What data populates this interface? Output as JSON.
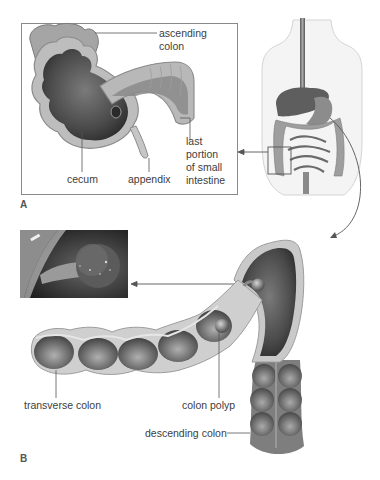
{
  "figure": {
    "panels": [
      {
        "id": "A",
        "letter": "A",
        "title": "Cecum region of large intestine (cutaway inset)",
        "labels": {
          "ascending_colon_line1": "ascending",
          "ascending_colon_line2": "colon",
          "cecum": "cecum",
          "appendix": "appendix",
          "small_intestine_line1": "last",
          "small_intestine_line2": "portion",
          "small_intestine_line3": "of small",
          "small_intestine_line4": "intestine"
        }
      },
      {
        "id": "B",
        "letter": "B",
        "title": "Transverse and descending colon with polyp",
        "labels": {
          "transverse_colon": "transverse colon",
          "colon_polyp": "colon polyp",
          "descending_colon": "descending colon"
        }
      }
    ],
    "torso_overview": {
      "description": "Human torso showing digestive tract with highlighted cecum region box"
    },
    "endoscopy_photo": {
      "description": "Endoscopic photograph of a colon polyp on a stalk"
    },
    "colors": {
      "background": "#ffffff",
      "tissue_light": "#c8c8c8",
      "tissue_mid": "#8e8e8e",
      "tissue_dark": "#3c3c3c",
      "line": "#555555",
      "text": "#3d3d3d"
    }
  }
}
